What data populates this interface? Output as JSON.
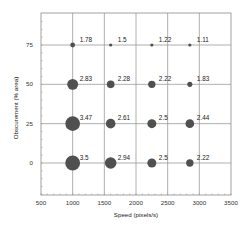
{
  "chart_data": {
    "type": "scatter",
    "subtype": "bubble",
    "title": "",
    "xlabel": "Speed (pixels/s)",
    "ylabel": "Obscurement (% area)",
    "xlim": [
      500,
      3500
    ],
    "ylim": [
      -20,
      92
    ],
    "xticks": [
      500,
      1000,
      1500,
      2000,
      2500,
      3000,
      3500
    ],
    "yticks": [
      0,
      25,
      50,
      75
    ],
    "xgrid": [
      1000,
      1500,
      2000,
      2500,
      3000
    ],
    "ygrid": [
      0,
      25,
      50,
      75
    ],
    "grid": true,
    "legend": null,
    "bubble_color": "#505050",
    "grid_color": "#9a9a9a",
    "points": [
      {
        "x": 1000,
        "y": 75,
        "value": 1.78,
        "label": "1.78"
      },
      {
        "x": 1600,
        "y": 75,
        "value": 1.5,
        "label": "1.5"
      },
      {
        "x": 2250,
        "y": 75,
        "value": 1.22,
        "label": "1.22"
      },
      {
        "x": 2850,
        "y": 75,
        "value": 1.11,
        "label": "1.11"
      },
      {
        "x": 1000,
        "y": 50,
        "value": 2.83,
        "label": "2.83"
      },
      {
        "x": 1600,
        "y": 50,
        "value": 2.28,
        "label": "2.28"
      },
      {
        "x": 2250,
        "y": 50,
        "value": 2.22,
        "label": "2.22"
      },
      {
        "x": 2850,
        "y": 50,
        "value": 1.83,
        "label": "1.83"
      },
      {
        "x": 1000,
        "y": 25,
        "value": 3.47,
        "label": "3.47"
      },
      {
        "x": 1600,
        "y": 25,
        "value": 2.61,
        "label": "2.61"
      },
      {
        "x": 2250,
        "y": 25,
        "value": 2.5,
        "label": "2.5"
      },
      {
        "x": 2850,
        "y": 25,
        "value": 2.44,
        "label": "2.44"
      },
      {
        "x": 1000,
        "y": 0,
        "value": 3.5,
        "label": "3.5"
      },
      {
        "x": 1600,
        "y": 0,
        "value": 2.94,
        "label": "2.94"
      },
      {
        "x": 2250,
        "y": 0,
        "value": 2.5,
        "label": "2.5"
      },
      {
        "x": 2850,
        "y": 0,
        "value": 2.22,
        "label": "2.22"
      }
    ]
  }
}
